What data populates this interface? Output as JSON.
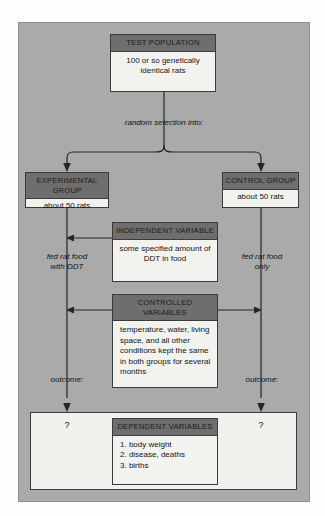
{
  "diagram": {
    "colors": {
      "panel_background": "#aaaaaa",
      "box_header": "#6e6e6e",
      "box_body": "#f2f2ef",
      "outline": "#3b3b3b",
      "page_background": "#fefefe"
    },
    "boxes": {
      "test_population": {
        "header": "TEST POPULATION",
        "body": "100 or so genetically identical rats"
      },
      "experimental_group": {
        "header": "EXPERIMENTAL GROUP",
        "body": "about 50 rats"
      },
      "control_group": {
        "header": "CONTROL GROUP",
        "body": "about 50 rats"
      },
      "independent_variable": {
        "header": "INDEPENDENT VARIABLE",
        "body": "some specified amount of DDT in food"
      },
      "controlled_variables": {
        "header": "CONTROLLED VARIABLES",
        "body": "temperature, water, living space, and all other conditions kept the same in both groups for several months"
      },
      "dependent_variables": {
        "header": "DEPENDENT VARIABLES",
        "items": [
          "1. body weight",
          "2. disease, deaths",
          "3. births"
        ]
      }
    },
    "annotations": {
      "random_selection": "random selection into:",
      "left_treatment": "fed rat food\nwith DDT",
      "right_treatment": "fed rat food\nonly",
      "left_outcome": "outcome:",
      "right_outcome": "outcome:",
      "left_question": "?",
      "right_question": "?"
    }
  }
}
